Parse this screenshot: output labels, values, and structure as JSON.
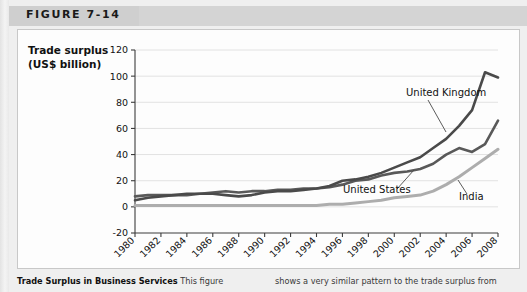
{
  "figure": {
    "label": "FIGURE 7-14"
  },
  "caption": {
    "title": "Trade Surplus in Business Services",
    "left_text": "This figure",
    "right_text": "shows a very similar pattern to the trade surplus from"
  },
  "chart_data": {
    "type": "line",
    "title": "",
    "xlabel": "",
    "ylabel": "Trade surplus (US$ billion)",
    "ylabel_line1": "Trade surplus",
    "ylabel_line2": "(US$ billion)",
    "grid": true,
    "legend_position": "inline-annotations",
    "xlim": [
      1980,
      2008
    ],
    "ylim": [
      -20,
      120
    ],
    "yticks": [
      -20,
      0,
      20,
      40,
      60,
      80,
      100,
      120
    ],
    "xticks": [
      1980,
      1982,
      1984,
      1986,
      1988,
      1990,
      1992,
      1994,
      1996,
      1998,
      2000,
      2002,
      2004,
      2006,
      2008
    ],
    "x": [
      1980,
      1981,
      1982,
      1983,
      1984,
      1985,
      1986,
      1987,
      1988,
      1989,
      1990,
      1991,
      1992,
      1993,
      1994,
      1995,
      1996,
      1997,
      1998,
      1999,
      2000,
      2001,
      2002,
      2003,
      2004,
      2005,
      2006,
      2007,
      2008
    ],
    "series": [
      {
        "name": "United Kingdom",
        "color": "#4a4a4a",
        "annotation": "United Kingdom",
        "values": [
          5,
          7,
          8,
          9,
          10,
          10,
          10,
          9,
          8,
          9,
          11,
          12,
          12,
          13,
          14,
          16,
          20,
          21,
          23,
          26,
          30,
          34,
          38,
          45,
          52,
          62,
          74,
          103,
          99
        ]
      },
      {
        "name": "United States",
        "color": "#595959",
        "annotation": "United States",
        "values": [
          8,
          9,
          9,
          9,
          9,
          10,
          11,
          12,
          11,
          12,
          12,
          13,
          13,
          14,
          14,
          15,
          17,
          20,
          21,
          24,
          26,
          27,
          29,
          33,
          40,
          45,
          42,
          48,
          66
        ]
      },
      {
        "name": "India",
        "color": "#adadad",
        "annotation": "India",
        "values": [
          1,
          1,
          1,
          1,
          1,
          1,
          1,
          1,
          1,
          1,
          1,
          1,
          1,
          1,
          1,
          2,
          2,
          3,
          4,
          5,
          7,
          8,
          9,
          12,
          17,
          23,
          30,
          37,
          44
        ]
      }
    ],
    "annotations": [
      {
        "label": "United Kingdom",
        "x": 400,
        "y": 92
      },
      {
        "label": "United States",
        "x": 342,
        "y": 189
      },
      {
        "label": "India",
        "x": 457,
        "y": 196
      }
    ]
  }
}
